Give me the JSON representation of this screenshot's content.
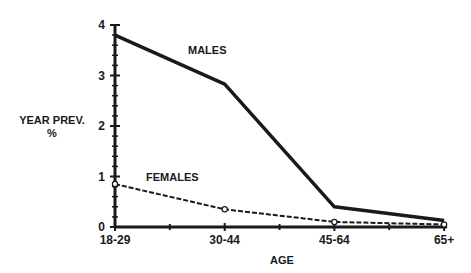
{
  "chart_data": {
    "type": "line",
    "title": "",
    "xlabel": "AGE",
    "ylabel": "YEAR PREV.",
    "ylabel_unit": "%",
    "categories": [
      "18-29",
      "30-44",
      "45-64",
      "65+"
    ],
    "ylim": [
      0,
      4
    ],
    "yticks": [
      0,
      1,
      2,
      3,
      4
    ],
    "grid": false,
    "legend": "inline labels",
    "series": [
      {
        "name": "MALES",
        "style": "solid",
        "marker": "none",
        "values": [
          3.8,
          2.83,
          0.4,
          0.13
        ]
      },
      {
        "name": "FEMALES",
        "style": "dashed",
        "marker": "open-circle",
        "values": [
          0.85,
          0.35,
          0.1,
          0.05
        ]
      }
    ],
    "annotations": [
      {
        "text": "MALES",
        "near": "30-44",
        "y": 3.5
      },
      {
        "text": "FEMALES",
        "near": "18-29 to 30-44",
        "y": 1.0
      }
    ]
  },
  "colors": {
    "ink": "#1a1a1a",
    "background": "#ffffff"
  }
}
